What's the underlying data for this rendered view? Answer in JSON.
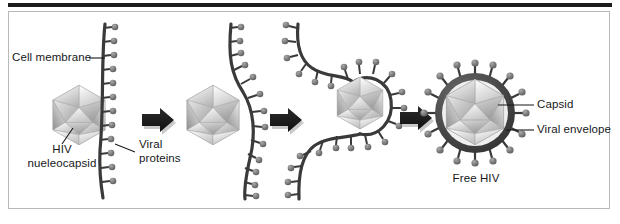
{
  "figure": {
    "background_color": "#ffffff",
    "border_color": "#b9b9b9",
    "rule_color": "#1c1c1c"
  },
  "labels": {
    "cell_membrane": "Cell membrane",
    "hiv_nucleocapsid_line1": "HIV",
    "hiv_nucleocapsid_line2": "nueleocapsid",
    "viral_proteins_line1": "Viral",
    "viral_proteins_line2": "proteins",
    "capsid": "Capsid",
    "viral_envelope": "Viral envelope",
    "free_hiv": "Free HIV"
  },
  "diagram": {
    "type": "process-diagram",
    "stage_count": 4,
    "arrow_count": 3,
    "stages": [
      {
        "index": 1,
        "name": "nucleocapsid-approaches-membrane",
        "description": "Free HIV nucleocapsid beside a straight cell membrane studded with viral proteins"
      },
      {
        "index": 2,
        "name": "membrane-begins-to-bulge",
        "description": "Nucleocapsid pushes against the membrane which curves outward"
      },
      {
        "index": 3,
        "name": "membrane-wraps-nucleocapsid",
        "description": "Membrane envelops the nucleocapsid, nearly pinching off"
      },
      {
        "index": 4,
        "name": "free-enveloped-virion",
        "description": "Released virion with a viral envelope and surface spikes"
      }
    ],
    "colors": {
      "membrane": "#3a3a3a",
      "spike_knob": "#6e6e6e",
      "envelope": "#4a4a4a",
      "capsid_light": "#f2f2f2",
      "capsid_mid": "#c9c9c9",
      "capsid_dark": "#9a9a9a",
      "arrow": "#1f1f1f",
      "leader_line": "#16181a"
    }
  }
}
